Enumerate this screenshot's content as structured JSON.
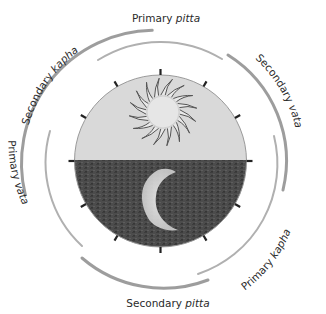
{
  "diagram": {
    "center": {
      "x": 160.5,
      "y": 161
    },
    "disc": {
      "radius": 86,
      "sky_color": "#d9d9d9",
      "ground_color": "#4a4a4a",
      "horizon_y": 160,
      "sun": {
        "cx": 163,
        "cy": 112,
        "r": 16,
        "ray_outer": 34,
        "rays": 16
      },
      "moon": {
        "description": "crescent moon reflected in dark ground"
      },
      "tick_count": 12
    },
    "arcs": [
      {
        "id": "primary-pitta",
        "ring": "inner",
        "label_main": "Primary ",
        "label_dosha": "pitta"
      },
      {
        "id": "secondary-vata",
        "ring": "outer",
        "label_main": "Secondary ",
        "label_dosha": "vata"
      },
      {
        "id": "primary-kapha",
        "ring": "inner",
        "label_main": "Primary ",
        "label_dosha": "kapha"
      },
      {
        "id": "secondary-pitta",
        "ring": "outer",
        "label_main": "Secondary ",
        "label_dosha": "pitta"
      },
      {
        "id": "primary-vata",
        "ring": "inner",
        "label_main": "Primary ",
        "label_dosha": "vata"
      },
      {
        "id": "secondary-kapha",
        "ring": "outer",
        "label_main": "Secondary ",
        "label_dosha": "kapha"
      }
    ],
    "colors": {
      "inner_arc": "#b0b0b0",
      "outer_arc": "#8c8c8c",
      "tick": "#222222",
      "text": "#2a2a2a"
    }
  }
}
